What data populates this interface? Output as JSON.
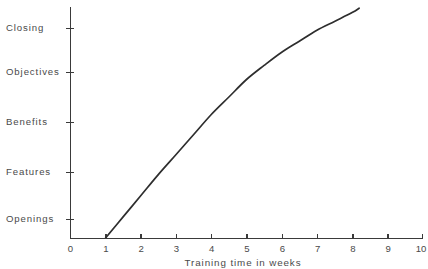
{
  "chart_data": {
    "type": "line",
    "title": "",
    "title_note": "cut off at top edge of image",
    "xlabel": "Training time in weeks",
    "ylabel": "",
    "xlim": [
      0,
      10
    ],
    "xticks": [
      "0",
      "1",
      "2",
      "3",
      "4",
      "5",
      "6",
      "7",
      "8",
      "9",
      "10"
    ],
    "yticks": [
      "Openings",
      "Features",
      "Benefits",
      "Objectives",
      "Closing"
    ],
    "ytick_order_top_to_bottom": [
      "Closing",
      "Objectives",
      "Benefits",
      "Features",
      "Openings"
    ],
    "grid": false,
    "legend": false,
    "line_color": "#2e2e2e",
    "background_color": "#ffffff",
    "series": [
      {
        "name": "Training progress",
        "x": [
          1.0,
          1.5,
          2.0,
          2.5,
          3.0,
          3.5,
          4.0,
          4.5,
          5.0,
          5.5,
          6.0,
          6.5,
          7.0,
          7.5,
          8.0,
          8.2
        ],
        "y_labels_scale": "Openings=0, Features=1, Benefits=2, Objectives=3, Closing=4",
        "y": [
          -0.4,
          0.05,
          0.5,
          0.95,
          1.35,
          1.75,
          2.15,
          2.5,
          2.85,
          3.15,
          3.45,
          3.7,
          3.95,
          4.15,
          4.35,
          4.45
        ]
      }
    ]
  },
  "axis": {
    "x_title": "Training time in weeks",
    "x_ticks": [
      {
        "label": "0",
        "value": 0
      },
      {
        "label": "1",
        "value": 1
      },
      {
        "label": "2",
        "value": 2
      },
      {
        "label": "3",
        "value": 3
      },
      {
        "label": "4",
        "value": 4
      },
      {
        "label": "5",
        "value": 5
      },
      {
        "label": "6",
        "value": 6
      },
      {
        "label": "7",
        "value": 7
      },
      {
        "label": "8",
        "value": 8
      },
      {
        "label": "9",
        "value": 9
      },
      {
        "label": "10",
        "value": 10
      }
    ],
    "y_ticks": [
      {
        "label": "Closing",
        "py": 28
      },
      {
        "label": "Objectives",
        "py": 72
      },
      {
        "label": "Benefits",
        "py": 122
      },
      {
        "label": "Features",
        "py": 172
      },
      {
        "label": "Openings",
        "py": 219
      }
    ]
  },
  "title_fragment": ""
}
